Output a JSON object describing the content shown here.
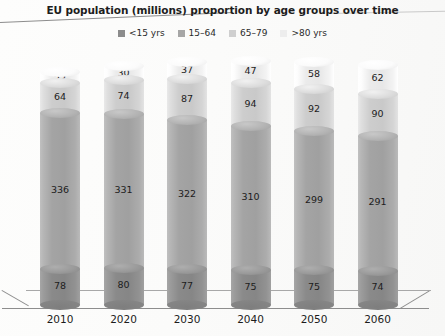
{
  "chart_data": {
    "type": "bar",
    "subtype": "stacked-cylinder-3d",
    "title": "EU population (millions) proportion by age groups over time",
    "xlabel": "",
    "ylabel": "",
    "grid": false,
    "legend_position": "top-center",
    "categories": [
      "2010",
      "2020",
      "2030",
      "2040",
      "2050",
      "2060"
    ],
    "series": [
      {
        "name": "<15 yrs",
        "color": "#8c8c8c",
        "values": [
          78,
          80,
          77,
          75,
          75,
          74
        ]
      },
      {
        "name": "15-64",
        "color": "#a6a6a6",
        "values": [
          336,
          331,
          322,
          310,
          299,
          291
        ]
      },
      {
        "name": "65-79",
        "color": "#cfcfcf",
        "values": [
          64,
          74,
          87,
          94,
          92,
          90
        ]
      },
      {
        "name": ">80 yrs",
        "color": "#ededed",
        "values": [
          23,
          30,
          37,
          47,
          58,
          62
        ]
      }
    ],
    "totals": [
      501,
      515,
      523,
      526,
      524,
      517
    ],
    "ylim": [
      0,
      530
    ],
    "stack_order": "bottom-to-top"
  },
  "title": {
    "text": "EU population (millions) proportion by age groups over time"
  },
  "legend": {
    "items": [
      {
        "label": "<15 yrs",
        "color": "#8c8c8c"
      },
      {
        "label": "15–64",
        "color": "#a6a6a6"
      },
      {
        "label": "65–79",
        "color": "#cfcfcf"
      },
      {
        "label": ">80 yrs",
        "color": "#ededed"
      }
    ]
  },
  "x_axis": {
    "ticks": [
      "2010",
      "2020",
      "2030",
      "2040",
      "2050",
      "2060"
    ]
  },
  "bars": [
    {
      "category": "2010",
      "segments": [
        {
          "series": ">80 yrs",
          "value": "23"
        },
        {
          "series": "65–79",
          "value": "64"
        },
        {
          "series": "15–64",
          "value": "336"
        },
        {
          "series": "<15 yrs",
          "value": "78"
        }
      ]
    },
    {
      "category": "2020",
      "segments": [
        {
          "series": ">80 yrs",
          "value": "30"
        },
        {
          "series": "65–79",
          "value": "74"
        },
        {
          "series": "15–64",
          "value": "331"
        },
        {
          "series": "<15 yrs",
          "value": "80"
        }
      ]
    },
    {
      "category": "2030",
      "segments": [
        {
          "series": ">80 yrs",
          "value": "37"
        },
        {
          "series": "65–79",
          "value": "87"
        },
        {
          "series": "15–64",
          "value": "322"
        },
        {
          "series": "<15 yrs",
          "value": "77"
        }
      ]
    },
    {
      "category": "2040",
      "segments": [
        {
          "series": ">80 yrs",
          "value": "47"
        },
        {
          "series": "65–79",
          "value": "94"
        },
        {
          "series": "15–64",
          "value": "310"
        },
        {
          "series": "<15 yrs",
          "value": "75"
        }
      ]
    },
    {
      "category": "2050",
      "segments": [
        {
          "series": ">80 yrs",
          "value": "58"
        },
        {
          "series": "65–79",
          "value": "92"
        },
        {
          "series": "15–64",
          "value": "299"
        },
        {
          "series": "<15 yrs",
          "value": "75"
        }
      ]
    },
    {
      "category": "2060",
      "segments": [
        {
          "series": ">80 yrs",
          "value": "62"
        },
        {
          "series": "65–79",
          "value": "90"
        },
        {
          "series": "15–64",
          "value": "291"
        },
        {
          "series": "<15 yrs",
          "value": "74"
        }
      ]
    }
  ]
}
